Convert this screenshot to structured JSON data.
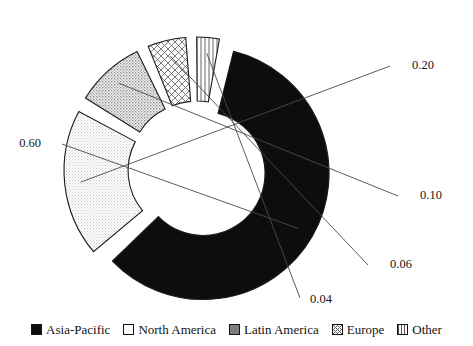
{
  "chart_data": {
    "type": "pie",
    "variant": "exploded-donut",
    "title": "",
    "subtitle": "",
    "xlabel": "",
    "ylabel": "",
    "grid": false,
    "legend_position": "bottom",
    "labels_format": "2-decimal fraction",
    "start_angle_deg": -78,
    "direction": "clockwise",
    "inner_radius_ratio": 0.5,
    "categories": [
      "Asia-Pacific",
      "North America",
      "Latin America",
      "Europe",
      "Other"
    ],
    "values": [
      0.6,
      0.2,
      0.1,
      0.06,
      0.04
    ],
    "value_labels": [
      "0.60",
      "0.20",
      "0.10",
      "0.06",
      "0.04"
    ],
    "slices": [
      {
        "name": "Asia-Pacific",
        "value": 0.6,
        "label": "0.60",
        "fill": "solid-black",
        "color": "#101010"
      },
      {
        "name": "North America",
        "value": 0.2,
        "label": "0.20",
        "fill": "light-stipple",
        "color": "#e9e9e9"
      },
      {
        "name": "Latin America",
        "value": 0.1,
        "label": "0.10",
        "fill": "medium-stipple",
        "color": "#b9b9b9"
      },
      {
        "name": "Europe",
        "value": 0.06,
        "label": "0.06",
        "fill": "diamond-crosshatch",
        "color": "#cfcfcf"
      },
      {
        "name": "Other",
        "value": 0.04,
        "label": "0.04",
        "fill": "vertical-hatch",
        "color": "#dcdcdc"
      }
    ]
  },
  "legend": {
    "items": [
      {
        "label": "Asia-Pacific",
        "swatch": "solid-black"
      },
      {
        "label": "North America",
        "swatch": "light-stipple"
      },
      {
        "label": "Latin America",
        "swatch": "medium-stipple"
      },
      {
        "label": "Europe",
        "swatch": "diamond-crosshatch"
      },
      {
        "label": "Other",
        "swatch": "vertical-hatch"
      }
    ]
  },
  "value_labels": {
    "asia_pacific": "0.60",
    "north_america": "0.20",
    "latin_america": "0.10",
    "europe": "0.06",
    "other": "0.04"
  },
  "colors": {
    "outline": "#1b1b1b",
    "leader": "#4a4a4a",
    "text": "#161616",
    "background": "#ffffff"
  }
}
